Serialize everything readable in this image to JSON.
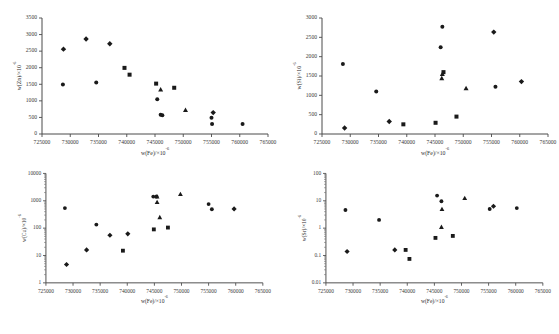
{
  "figure": {
    "title": "",
    "background": "#ffffff",
    "marker_color": "#1a1a1a",
    "axis_color": "#4a4a4a"
  },
  "chart_data": [
    {
      "id": "zn",
      "type": "scatter",
      "title": "",
      "xlabel": "w(Fe)/×10",
      "xlabel_sup": "-6",
      "ylabel": "w(Zn)/×10",
      "ylabel_sup": "-6",
      "xscale": "linear",
      "yscale": "linear",
      "xlim": [
        725000,
        765000
      ],
      "ylim": [
        0,
        3500
      ],
      "xticks": [
        725000,
        730000,
        735000,
        740000,
        745000,
        750000,
        755000,
        760000,
        765000
      ],
      "yticks": [
        0,
        500,
        1000,
        1500,
        2000,
        2500,
        3000,
        3500
      ],
      "grid": false,
      "legend": "none",
      "points": [
        {
          "x": 728800,
          "y": 2560,
          "marker": "diamond"
        },
        {
          "x": 728700,
          "y": 1490,
          "marker": "circle"
        },
        {
          "x": 732800,
          "y": 2865,
          "marker": "diamond"
        },
        {
          "x": 734600,
          "y": 1555,
          "marker": "circle"
        },
        {
          "x": 737000,
          "y": 2725,
          "marker": "diamond"
        },
        {
          "x": 739600,
          "y": 1995,
          "marker": "square"
        },
        {
          "x": 740500,
          "y": 1790,
          "marker": "square"
        },
        {
          "x": 745200,
          "y": 1520,
          "marker": "square"
        },
        {
          "x": 746000,
          "y": 1345,
          "marker": "triangle"
        },
        {
          "x": 748400,
          "y": 1395,
          "marker": "square"
        },
        {
          "x": 745400,
          "y": 1045,
          "marker": "circle"
        },
        {
          "x": 746000,
          "y": 580,
          "marker": "circle"
        },
        {
          "x": 746300,
          "y": 565,
          "marker": "circle"
        },
        {
          "x": 750400,
          "y": 725,
          "marker": "triangle"
        },
        {
          "x": 755300,
          "y": 645,
          "marker": "diamond"
        },
        {
          "x": 755000,
          "y": 490,
          "marker": "circle"
        },
        {
          "x": 755100,
          "y": 300,
          "marker": "circle"
        },
        {
          "x": 760500,
          "y": 300,
          "marker": "circle"
        }
      ]
    },
    {
      "id": "si",
      "type": "scatter",
      "title": "",
      "xlabel": "w(Fe)/×10",
      "xlabel_sup": "-6",
      "ylabel": "w(Si)/×10",
      "ylabel_sup": "-6",
      "xscale": "linear",
      "yscale": "linear",
      "xlim": [
        725000,
        765000
      ],
      "ylim": [
        0,
        3000
      ],
      "xticks": [
        725000,
        730000,
        735000,
        740000,
        745000,
        750000,
        755000,
        760000,
        765000
      ],
      "yticks": [
        0,
        500,
        1000,
        1500,
        2000,
        2500,
        3000
      ],
      "grid": false,
      "legend": "none",
      "points": [
        {
          "x": 728700,
          "y": 1810,
          "marker": "circle"
        },
        {
          "x": 729000,
          "y": 155,
          "marker": "diamond"
        },
        {
          "x": 734600,
          "y": 1100,
          "marker": "circle"
        },
        {
          "x": 736900,
          "y": 325,
          "marker": "diamond"
        },
        {
          "x": 739400,
          "y": 250,
          "marker": "square"
        },
        {
          "x": 745100,
          "y": 290,
          "marker": "square"
        },
        {
          "x": 746300,
          "y": 2775,
          "marker": "circle"
        },
        {
          "x": 746000,
          "y": 2245,
          "marker": "circle"
        },
        {
          "x": 746500,
          "y": 1600,
          "marker": "square"
        },
        {
          "x": 746300,
          "y": 1550,
          "marker": "triangle"
        },
        {
          "x": 746200,
          "y": 1440,
          "marker": "triangle"
        },
        {
          "x": 748800,
          "y": 450,
          "marker": "square"
        },
        {
          "x": 750500,
          "y": 1180,
          "marker": "triangle"
        },
        {
          "x": 755400,
          "y": 2635,
          "marker": "diamond"
        },
        {
          "x": 755700,
          "y": 1220,
          "marker": "circle"
        },
        {
          "x": 760300,
          "y": 1355,
          "marker": "diamond"
        }
      ]
    },
    {
      "id": "cu",
      "type": "scatter",
      "title": "",
      "xlabel": "w(Fe)/×10",
      "xlabel_sup": "-6",
      "ylabel": "w(Cu)/×10",
      "ylabel_sup": "-6",
      "xscale": "linear",
      "yscale": "log",
      "xlim": [
        725000,
        765000
      ],
      "ylim": [
        1,
        10000
      ],
      "xticks": [
        725000,
        730000,
        735000,
        740000,
        745000,
        750000,
        755000,
        760000,
        765000
      ],
      "yticks": [
        1,
        10,
        100,
        1000,
        10000
      ],
      "grid": false,
      "legend": "none",
      "points": [
        {
          "x": 728500,
          "y": 540,
          "marker": "circle"
        },
        {
          "x": 728800,
          "y": 4.7,
          "marker": "diamond"
        },
        {
          "x": 732500,
          "y": 16,
          "marker": "diamond"
        },
        {
          "x": 734300,
          "y": 135,
          "marker": "circle"
        },
        {
          "x": 736800,
          "y": 55,
          "marker": "diamond"
        },
        {
          "x": 739200,
          "y": 15,
          "marker": "square"
        },
        {
          "x": 740100,
          "y": 62,
          "marker": "diamond"
        },
        {
          "x": 744900,
          "y": 90,
          "marker": "square"
        },
        {
          "x": 744800,
          "y": 1420,
          "marker": "circle"
        },
        {
          "x": 745400,
          "y": 1430,
          "marker": "circle"
        },
        {
          "x": 745500,
          "y": 900,
          "marker": "triangle"
        },
        {
          "x": 745500,
          "y": 1420,
          "marker": "triangle"
        },
        {
          "x": 746000,
          "y": 250,
          "marker": "triangle"
        },
        {
          "x": 747500,
          "y": 105,
          "marker": "square"
        },
        {
          "x": 749800,
          "y": 1750,
          "marker": "triangle"
        },
        {
          "x": 755000,
          "y": 760,
          "marker": "circle"
        },
        {
          "x": 755600,
          "y": 490,
          "marker": "circle"
        },
        {
          "x": 759700,
          "y": 505,
          "marker": "diamond"
        }
      ]
    },
    {
      "id": "sr",
      "type": "scatter",
      "title": "",
      "xlabel": "w(Fe)/×10",
      "xlabel_sup": "-6",
      "ylabel": "w(Sr)/×10",
      "ylabel_sup": "-6",
      "xscale": "linear",
      "yscale": "log",
      "xlim": [
        725000,
        765000
      ],
      "ylim": [
        0.01,
        100
      ],
      "xticks": [
        725000,
        730000,
        735000,
        740000,
        745000,
        750000,
        755000,
        760000,
        765000
      ],
      "yticks": [
        0.01,
        0.1,
        1,
        10,
        100
      ],
      "grid": false,
      "legend": "none",
      "points": [
        {
          "x": 728600,
          "y": 4.6,
          "marker": "circle"
        },
        {
          "x": 728900,
          "y": 0.14,
          "marker": "diamond"
        },
        {
          "x": 734800,
          "y": 2.0,
          "marker": "circle"
        },
        {
          "x": 737700,
          "y": 0.16,
          "marker": "diamond"
        },
        {
          "x": 739700,
          "y": 0.16,
          "marker": "square"
        },
        {
          "x": 740400,
          "y": 0.075,
          "marker": "square"
        },
        {
          "x": 745200,
          "y": 0.44,
          "marker": "square"
        },
        {
          "x": 745500,
          "y": 15.5,
          "marker": "circle"
        },
        {
          "x": 746300,
          "y": 9.6,
          "marker": "circle"
        },
        {
          "x": 746400,
          "y": 5.0,
          "marker": "triangle"
        },
        {
          "x": 746300,
          "y": 1.1,
          "marker": "triangle"
        },
        {
          "x": 748400,
          "y": 0.52,
          "marker": "square"
        },
        {
          "x": 750600,
          "y": 12.5,
          "marker": "triangle"
        },
        {
          "x": 755200,
          "y": 5.0,
          "marker": "circle"
        },
        {
          "x": 755900,
          "y": 6.3,
          "marker": "diamond"
        },
        {
          "x": 760200,
          "y": 5.4,
          "marker": "circle"
        }
      ]
    }
  ]
}
